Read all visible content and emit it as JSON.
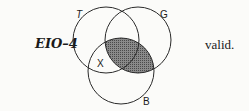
{
  "form_label": "EIO–4",
  "verdict": "valid.",
  "diagram": {
    "circles": [
      {
        "name": "T",
        "cx": 106,
        "cy": 40,
        "r": 33
      },
      {
        "name": "G",
        "cx": 138,
        "cy": 40,
        "r": 33
      },
      {
        "name": "B",
        "cx": 121,
        "cy": 71,
        "r": 33
      }
    ],
    "labels": {
      "T": "T",
      "G": "G",
      "B": "B",
      "X": "X"
    },
    "shaded_region": "G∩B",
    "colors": {
      "stroke": "#2a2a2a",
      "shade": "#6a6a6a"
    }
  }
}
